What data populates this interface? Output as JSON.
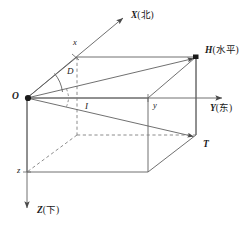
{
  "figure": {
    "kind": "3d-coordinate-diagram",
    "background": "#ffffff",
    "stroke": "#555555",
    "dash_stroke": "#777777",
    "text_color": "#1a1a1a",
    "width": 251,
    "height": 233
  },
  "axes": [
    {
      "name": "x-axis",
      "label_main": "X",
      "label_paren": "(北)",
      "meaning": "north",
      "tick_label": "x"
    },
    {
      "name": "y-axis",
      "label_main": "Y",
      "label_paren": "(东)",
      "meaning": "east",
      "tick_label": "y"
    },
    {
      "name": "z-axis",
      "label_main": "Z",
      "label_paren": "(下)",
      "meaning": "down",
      "tick_label": "z"
    }
  ],
  "points": [
    {
      "name": "origin",
      "label": "O"
    },
    {
      "name": "horizontal-point",
      "label": "H",
      "label_paren": "(水平)",
      "meaning": "horizontal"
    },
    {
      "name": "target-point",
      "label": "T"
    }
  ],
  "angles": [
    {
      "name": "azimuth-angle",
      "label": "D"
    },
    {
      "name": "inclination-angle",
      "label": "I"
    }
  ]
}
